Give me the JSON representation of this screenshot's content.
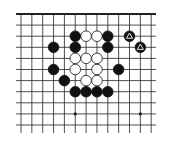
{
  "board": {
    "type": "go-diagram",
    "columns": 13,
    "rows": 11,
    "top_edge": true,
    "colors": {
      "line": "#222222",
      "black": "#111111",
      "white": "#ffffff",
      "background": "#ffffff"
    },
    "star_points": [
      [
        5,
        9
      ],
      [
        11,
        9
      ]
    ],
    "stones": [
      {
        "color": "black",
        "col": 5,
        "row": 2
      },
      {
        "color": "white",
        "col": 6,
        "row": 2
      },
      {
        "color": "white",
        "col": 7,
        "row": 2
      },
      {
        "color": "black",
        "col": 8,
        "row": 2
      },
      {
        "color": "black",
        "col": 10,
        "row": 2,
        "mark": "triangle"
      },
      {
        "color": "black",
        "col": 3,
        "row": 3
      },
      {
        "color": "black",
        "col": 5,
        "row": 3
      },
      {
        "color": "black",
        "col": 8,
        "row": 3
      },
      {
        "color": "black",
        "col": 11,
        "row": 3,
        "mark": "triangle"
      },
      {
        "color": "white",
        "col": 5,
        "row": 4
      },
      {
        "color": "white",
        "col": 6,
        "row": 4
      },
      {
        "color": "white",
        "col": 7,
        "row": 4
      },
      {
        "color": "black",
        "col": 3,
        "row": 5
      },
      {
        "color": "white",
        "col": 5,
        "row": 5
      },
      {
        "color": "white",
        "col": 7,
        "row": 5
      },
      {
        "color": "black",
        "col": 9,
        "row": 5
      },
      {
        "color": "black",
        "col": 4,
        "row": 6
      },
      {
        "color": "white",
        "col": 6,
        "row": 6
      },
      {
        "color": "white",
        "col": 7,
        "row": 6
      },
      {
        "color": "black",
        "col": 5,
        "row": 7
      },
      {
        "color": "black",
        "col": 6,
        "row": 7
      },
      {
        "color": "black",
        "col": 7,
        "row": 7
      },
      {
        "color": "black",
        "col": 8,
        "row": 7
      }
    ]
  }
}
